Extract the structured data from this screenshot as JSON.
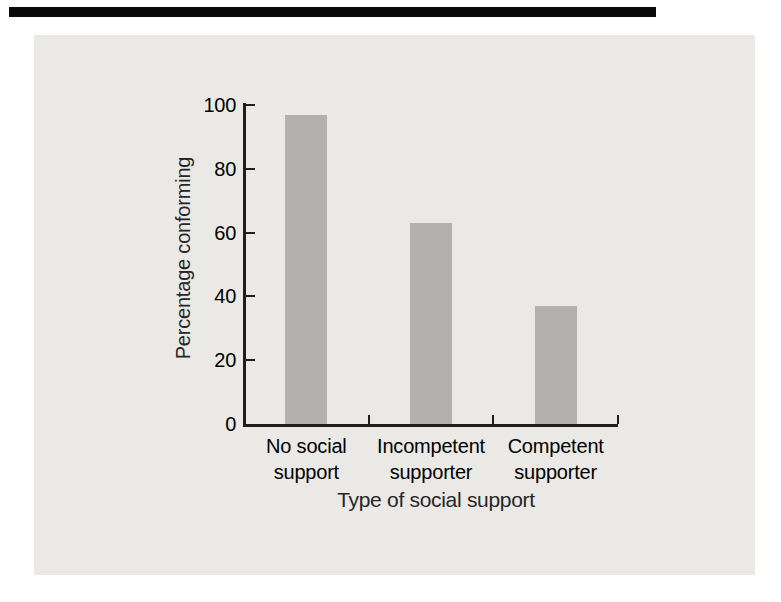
{
  "chart_data": {
    "type": "bar",
    "categories": [
      "No social support",
      "Incompetent supporter",
      "Competent supporter"
    ],
    "category_label_lines": [
      [
        "No social",
        "support"
      ],
      [
        "Incompetent",
        "supporter"
      ],
      [
        "Competent",
        "supporter"
      ]
    ],
    "values": [
      97,
      63,
      37
    ],
    "title": "",
    "xlabel": "Type of social support",
    "ylabel": "Percentage conforming",
    "yticks": [
      0,
      20,
      40,
      60,
      80,
      100
    ],
    "ylim": [
      0,
      100
    ],
    "grid": false,
    "legend": false,
    "tick_direction": "in",
    "bar_color": "#b3b1ae",
    "axis_color": "#1f1f1f",
    "text_color": "#262626",
    "panel_bg": "#ebe9e6"
  },
  "colors": {
    "page_bg": "#ffffff",
    "scan_artifact_bar": "#0a0a0a"
  }
}
